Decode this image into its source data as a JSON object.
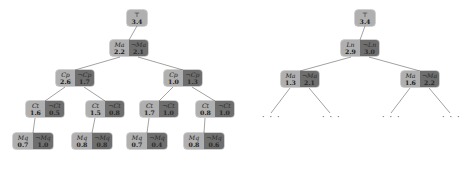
{
  "figure": {
    "type": "search-tree-pair",
    "colors": {
      "positive_cell": "#b0b0b0",
      "negative_cell": "#6e6e6e",
      "edge": "#8a8a8a",
      "background": "#ffffff"
    },
    "negation_symbol": "¬",
    "ellipsis_label": "· · ·"
  },
  "trees": [
    {
      "id": "left-tree",
      "nodes": [
        {
          "id": "L-root",
          "row": 0,
          "x": 127,
          "y": 10,
          "cells": [
            {
              "kind": "pos",
              "literal": "⊤",
              "value": "3.4",
              "width": 20
            }
          ]
        },
        {
          "id": "L-ma",
          "row": 1,
          "x": 110,
          "y": 40,
          "cells": [
            {
              "kind": "pos",
              "literal": "Ma",
              "value": "2.2",
              "width": 19
            },
            {
              "kind": "neg",
              "literal": "¬Ma",
              "value": "2.1",
              "width": 19
            }
          ]
        },
        {
          "id": "L-cp-left",
          "row": 2,
          "x": 56,
          "y": 70,
          "cells": [
            {
              "kind": "pos",
              "literal": "Cp",
              "value": "2.6",
              "width": 19
            },
            {
              "kind": "neg",
              "literal": "¬Cp",
              "value": "1.7",
              "width": 19
            }
          ]
        },
        {
          "id": "L-cp-right",
          "row": 2,
          "x": 164,
          "y": 70,
          "cells": [
            {
              "kind": "pos",
              "literal": "Cp",
              "value": "1.0",
              "width": 19
            },
            {
              "kind": "neg",
              "literal": "¬Cp",
              "value": "1.3",
              "width": 19
            }
          ]
        },
        {
          "id": "L-ct-1",
          "row": 3,
          "x": 26,
          "y": 101,
          "cells": [
            {
              "kind": "pos",
              "literal": "Ct",
              "value": "1.6",
              "width": 19
            },
            {
              "kind": "neg",
              "literal": "¬Ct",
              "value": "0.5",
              "width": 19
            }
          ]
        },
        {
          "id": "L-ct-2",
          "row": 3,
          "x": 86,
          "y": 101,
          "cells": [
            {
              "kind": "pos",
              "literal": "Ct",
              "value": "1.5",
              "width": 19
            },
            {
              "kind": "neg",
              "literal": "¬Ct",
              "value": "0.8",
              "width": 19
            }
          ]
        },
        {
          "id": "L-ct-3",
          "row": 3,
          "x": 140,
          "y": 101,
          "cells": [
            {
              "kind": "pos",
              "literal": "Ct",
              "value": "1.7",
              "width": 19
            },
            {
              "kind": "neg",
              "literal": "¬Ct",
              "value": "1.0",
              "width": 19
            }
          ]
        },
        {
          "id": "L-ct-4",
          "row": 3,
          "x": 196,
          "y": 101,
          "cells": [
            {
              "kind": "pos",
              "literal": "Ct",
              "value": "0.8",
              "width": 19
            },
            {
              "kind": "neg",
              "literal": "¬Ct",
              "value": "1.0",
              "width": 19
            }
          ]
        },
        {
          "id": "L-mq-1",
          "row": 4,
          "x": 13,
          "y": 133,
          "cells": [
            {
              "kind": "pos",
              "literal": "Mq",
              "value": "0.7",
              "width": 20
            },
            {
              "kind": "neg",
              "literal": "¬Mq",
              "value": "1.0",
              "width": 20
            }
          ]
        },
        {
          "id": "L-mq-2",
          "row": 4,
          "x": 72,
          "y": 133,
          "cells": [
            {
              "kind": "pos",
              "literal": "Mq",
              "value": "0.8",
              "width": 20
            },
            {
              "kind": "neg",
              "literal": "¬Mq",
              "value": "0.8",
              "width": 20
            }
          ]
        },
        {
          "id": "L-mq-3",
          "row": 4,
          "x": 127,
          "y": 133,
          "cells": [
            {
              "kind": "pos",
              "literal": "Mq",
              "value": "0.7",
              "width": 20
            },
            {
              "kind": "neg",
              "literal": "¬Mq",
              "value": "0.4",
              "width": 20
            }
          ]
        },
        {
          "id": "L-mq-4",
          "row": 4,
          "x": 184,
          "y": 133,
          "cells": [
            {
              "kind": "pos",
              "literal": "Mq",
              "value": "0.8",
              "width": 20
            },
            {
              "kind": "neg",
              "literal": "¬Mq",
              "value": "0.6",
              "width": 20
            }
          ]
        }
      ],
      "edges": [
        {
          "from": "L-root",
          "to": "L-ma",
          "x1": 137,
          "y1": 26,
          "x2": 129,
          "y2": 40
        },
        {
          "from": "L-ma",
          "to": "L-cp-left",
          "x1": 120,
          "y1": 57,
          "x2": 75,
          "y2": 70
        },
        {
          "from": "L-ma",
          "to": "L-cp-right",
          "x1": 138,
          "y1": 57,
          "x2": 183,
          "y2": 70
        },
        {
          "from": "L-cp-left",
          "to": "L-ct-1",
          "x1": 65,
          "y1": 87,
          "x2": 45,
          "y2": 101
        },
        {
          "from": "L-cp-left",
          "to": "L-ct-2",
          "x1": 84,
          "y1": 87,
          "x2": 105,
          "y2": 101
        },
        {
          "from": "L-cp-right",
          "to": "L-ct-3",
          "x1": 173,
          "y1": 87,
          "x2": 159,
          "y2": 101
        },
        {
          "from": "L-cp-right",
          "to": "L-ct-4",
          "x1": 192,
          "y1": 87,
          "x2": 215,
          "y2": 101
        },
        {
          "from": "L-ct-1",
          "to": "L-mq-1",
          "x1": 35,
          "y1": 118,
          "x2": 33,
          "y2": 133
        },
        {
          "from": "L-ct-2",
          "to": "L-mq-2",
          "x1": 95,
          "y1": 118,
          "x2": 92,
          "y2": 133
        },
        {
          "from": "L-ct-3",
          "to": "L-mq-3",
          "x1": 149,
          "y1": 118,
          "x2": 147,
          "y2": 133
        },
        {
          "from": "L-ct-4",
          "to": "L-mq-4",
          "x1": 205,
          "y1": 118,
          "x2": 204,
          "y2": 133
        }
      ],
      "ellipses": []
    },
    {
      "id": "right-tree",
      "nodes": [
        {
          "id": "R-root",
          "row": 0,
          "x": 355,
          "y": 10,
          "cells": [
            {
              "kind": "pos",
              "literal": "⊤",
              "value": "3.4",
              "width": 20
            }
          ]
        },
        {
          "id": "R-ln",
          "row": 1,
          "x": 341,
          "y": 40,
          "cells": [
            {
              "kind": "pos",
              "literal": "Ln",
              "value": "2.9",
              "width": 19
            },
            {
              "kind": "neg",
              "literal": "¬Ln",
              "value": "3.0",
              "width": 19
            }
          ]
        },
        {
          "id": "R-ma-left",
          "row": 2,
          "x": 281,
          "y": 71,
          "cells": [
            {
              "kind": "pos",
              "literal": "Ma",
              "value": "1.3",
              "width": 19
            },
            {
              "kind": "neg",
              "literal": "¬Ma",
              "value": "2.1",
              "width": 19
            }
          ]
        },
        {
          "id": "R-ma-right",
          "row": 2,
          "x": 401,
          "y": 71,
          "cells": [
            {
              "kind": "pos",
              "literal": "Ma",
              "value": "1.6",
              "width": 19
            },
            {
              "kind": "neg",
              "literal": "¬Ma",
              "value": "2.2",
              "width": 19
            }
          ]
        }
      ],
      "edges": [
        {
          "from": "R-root",
          "to": "R-ln",
          "x1": 365,
          "y1": 26,
          "x2": 360,
          "y2": 40
        },
        {
          "from": "R-ln",
          "to": "R-ma-left",
          "x1": 351,
          "y1": 57,
          "x2": 300,
          "y2": 71
        },
        {
          "from": "R-ln",
          "to": "R-ma-right",
          "x1": 369,
          "y1": 57,
          "x2": 420,
          "y2": 71
        },
        {
          "from": "R-ma-left",
          "to": "dots-1",
          "x1": 290,
          "y1": 88,
          "x2": 271,
          "y2": 113
        },
        {
          "from": "R-ma-left",
          "to": "dots-2",
          "x1": 309,
          "y1": 88,
          "x2": 330,
          "y2": 113
        },
        {
          "from": "R-ma-right",
          "to": "dots-3",
          "x1": 410,
          "y1": 88,
          "x2": 391,
          "y2": 113
        },
        {
          "from": "R-ma-right",
          "to": "dots-4",
          "x1": 429,
          "y1": 88,
          "x2": 450,
          "y2": 113
        }
      ],
      "ellipses": [
        {
          "id": "dots-1",
          "x": 262,
          "y": 114
        },
        {
          "id": "dots-2",
          "x": 322,
          "y": 114
        },
        {
          "id": "dots-3",
          "x": 382,
          "y": 114
        },
        {
          "id": "dots-4",
          "x": 442,
          "y": 114
        }
      ]
    }
  ]
}
